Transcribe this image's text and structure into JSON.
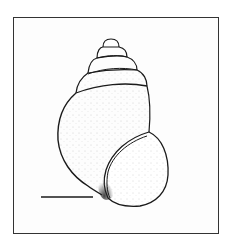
{
  "figure": {
    "frame_color": "#333333",
    "line_color": "#1a1a1a",
    "stipple_color": "#555555",
    "scale_bar": {
      "label": ""
    }
  }
}
